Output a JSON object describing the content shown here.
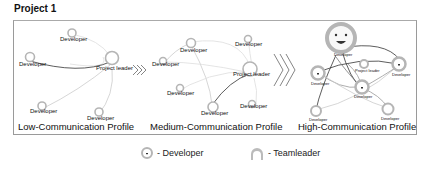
{
  "title": "Project 1",
  "panels": [
    {
      "label": "Low-Communication Profile",
      "leader_label": "Project leader",
      "node_label": "Developer"
    },
    {
      "label": "Medium-Communication Profile",
      "leader_label": "Project leader",
      "node_label": "Developer"
    },
    {
      "label": "High-Communication Profile",
      "leader_label": "Project leader",
      "node_label": "Developer"
    }
  ],
  "legend": {
    "developer": "- Developer",
    "teamleader": "- Teamleader"
  },
  "colors": {
    "node": "#b0b0b0",
    "edge_dark": "#333333",
    "edge_light": "#cfcfcf",
    "frame": "#9a9a9a"
  }
}
